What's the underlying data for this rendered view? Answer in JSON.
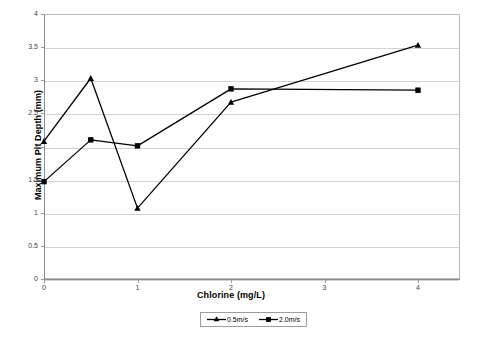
{
  "chart_data": {
    "type": "line",
    "title": "",
    "xlabel": "Chlorine (mg/L)",
    "ylabel": "Maximum Pit Depth (mm)",
    "xlim": [
      0,
      4.45
    ],
    "ylim": [
      0,
      4
    ],
    "grid": true,
    "legend_position": "bottom",
    "xticks": [
      "0",
      "1",
      "2",
      "3",
      "4"
    ],
    "xtick_values": [
      0,
      1,
      2,
      3,
      4
    ],
    "yticks": [
      "0",
      "0.5",
      "1",
      "1.5",
      "2",
      "2.5",
      "3",
      "3.5",
      "4"
    ],
    "ytick_values": [
      0,
      0.5,
      1,
      1.5,
      2,
      2.5,
      3,
      3.5,
      4
    ],
    "x": [
      0,
      0.5,
      1,
      2,
      4
    ],
    "series": [
      {
        "name": "0.5m/s",
        "marker": "triangle",
        "color": "#000000",
        "values": [
          2.08,
          3.03,
          1.07,
          2.67,
          3.53
        ]
      },
      {
        "name": "2.0m/s",
        "marker": "square",
        "color": "#000000",
        "values": [
          1.47,
          2.1,
          2.01,
          2.87,
          2.85
        ]
      }
    ]
  },
  "legend": {
    "items": [
      {
        "label": "0.5m/s",
        "marker": "triangle"
      },
      {
        "label": "2.0m/s",
        "marker": "square"
      }
    ]
  },
  "colors": {
    "line": "#000000",
    "grid": "#d3d3d3",
    "axis": "#8d8d8d",
    "text": "#000000",
    "tick_text": "#444444",
    "background": "#ffffff"
  }
}
